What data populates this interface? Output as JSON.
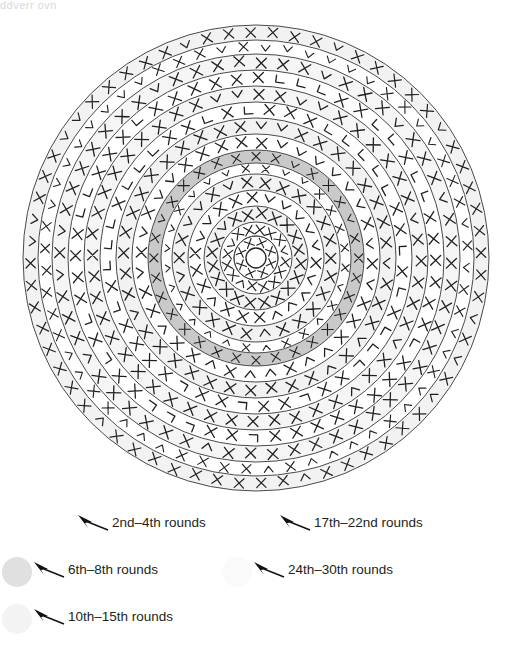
{
  "page": {
    "top_cropped_text": "ddverr ovn",
    "background_color": "#ffffff",
    "ink_color": "#231f20"
  },
  "diagram": {
    "name": "circular-crochet-round-chart",
    "center": {
      "x": 256,
      "y": 258
    },
    "outer_radius": 233,
    "center_ring_radius": 10,
    "center_ring_stitch_count": 8,
    "stitch_symbols": {
      "single_crochet": "X",
      "increase": "V",
      "corner_increase": "L"
    },
    "ring_boundaries_radius": [
      22,
      36,
      52,
      68,
      84,
      95,
      108,
      124,
      140,
      156,
      172,
      188,
      204,
      218,
      233
    ],
    "bands": [
      {
        "index": 1,
        "inner": 22,
        "outer": 36,
        "fill": "#ffffff",
        "symbol": "X",
        "count": 16
      },
      {
        "index": 2,
        "inner": 36,
        "outer": 52,
        "fill": "#f2f2f2",
        "symbol": "X",
        "count": 20
      },
      {
        "index": 3,
        "inner": 52,
        "outer": 68,
        "fill": "#ffffff",
        "symbol": "V",
        "count": 22
      },
      {
        "index": 4,
        "inner": 68,
        "outer": 84,
        "fill": "#f2f2f2",
        "symbol": "X",
        "count": 26
      },
      {
        "index": 5,
        "inner": 84,
        "outer": 95,
        "fill": "#ffffff",
        "symbol": "V",
        "count": 28
      },
      {
        "index": 6,
        "inner": 95,
        "outer": 108,
        "fill": "#c9c9c9",
        "symbol": "X",
        "count": 32
      },
      {
        "index": 7,
        "inner": 108,
        "outer": 124,
        "fill": "#ffffff",
        "symbol": "V",
        "count": 36
      },
      {
        "index": 8,
        "inner": 124,
        "outer": 140,
        "fill": "#f2f2f2",
        "symbol": "X",
        "count": 40
      },
      {
        "index": 9,
        "inner": 140,
        "outer": 156,
        "fill": "#ffffff",
        "symbol": "L",
        "count": 44
      },
      {
        "index": 10,
        "inner": 156,
        "outer": 172,
        "fill": "#f5f5f5",
        "symbol": "X",
        "count": 48
      },
      {
        "index": 11,
        "inner": 172,
        "outer": 188,
        "fill": "#ffffff",
        "symbol": "L",
        "count": 52
      },
      {
        "index": 12,
        "inner": 188,
        "outer": 204,
        "fill": "#f5f5f5",
        "symbol": "X",
        "count": 56
      },
      {
        "index": 13,
        "inner": 204,
        "outer": 218,
        "fill": "#ffffff",
        "symbol": "V",
        "count": 60
      },
      {
        "index": 14,
        "inner": 218,
        "outer": 233,
        "fill": "#f2f2f2",
        "symbol": "X",
        "count": 64
      }
    ]
  },
  "legend": {
    "entries": [
      {
        "id": "rounds-2-4",
        "label": "2nd–4th rounds",
        "swatch_color": "none",
        "has_swatch": false,
        "arrow": "arrow-pointer-left"
      },
      {
        "id": "rounds-6-8",
        "label": "6th–8th rounds",
        "swatch_color": "#e0e0e0",
        "has_swatch": true,
        "arrow": "arrow-pointer-left"
      },
      {
        "id": "rounds-10-15",
        "label": "10th–15th rounds",
        "swatch_color": "#f3f3f3",
        "has_swatch": true,
        "arrow": "arrow-pointer-left"
      },
      {
        "id": "rounds-17-22",
        "label": "17th–22nd rounds",
        "swatch_color": "none",
        "has_swatch": false,
        "arrow": "arrow-pointer-left"
      },
      {
        "id": "rounds-24-30",
        "label": "24th–30th rounds",
        "swatch_color": "#fafafa",
        "has_swatch": true,
        "arrow": "arrow-pointer-left"
      }
    ]
  }
}
